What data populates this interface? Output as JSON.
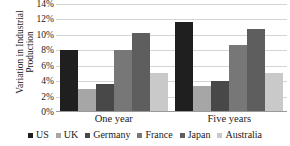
{
  "chart_data": {
    "type": "bar",
    "title": "",
    "xlabel": "",
    "ylabel": "Variation in Industrial Production",
    "ylabel_line1": "Variation in Industrial",
    "ylabel_line2": "Production",
    "categories": [
      "One year",
      "Five years"
    ],
    "ylim": [
      0,
      14
    ],
    "ytick_labels": [
      "0%",
      "2%",
      "4%",
      "6%",
      "8%",
      "10%",
      "12%",
      "14%"
    ],
    "ytick_values": [
      0,
      2,
      4,
      6,
      8,
      10,
      12,
      14
    ],
    "grid": true,
    "legend_position": "bottom",
    "series": [
      {
        "name": "US",
        "color": "#1f1f1f",
        "values": [
          8.0,
          11.7
        ]
      },
      {
        "name": "UK",
        "color": "#a6a6a6",
        "values": [
          3.0,
          3.4
        ]
      },
      {
        "name": "Germany",
        "color": "#484848",
        "values": [
          3.6,
          4.0
        ]
      },
      {
        "name": "France",
        "color": "#777777",
        "values": [
          8.0,
          8.7
        ]
      },
      {
        "name": "Japan",
        "color": "#5e5e5e",
        "values": [
          10.2,
          10.7
        ]
      },
      {
        "name": "Australia",
        "color": "#c9c9c9",
        "values": [
          5.0,
          5.0
        ]
      }
    ]
  }
}
